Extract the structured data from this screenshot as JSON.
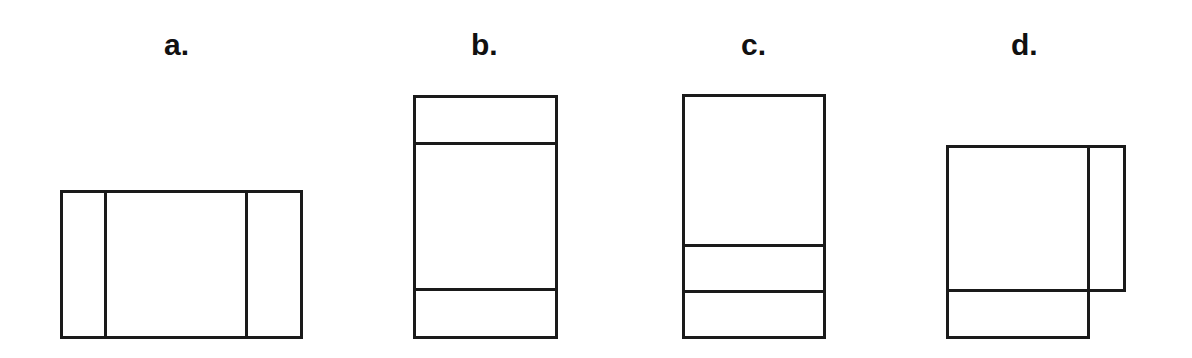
{
  "figure": {
    "background_color": "#ffffff",
    "stroke_color": "#1a1a1a",
    "stroke_width": 3,
    "width": 1192,
    "height": 358
  },
  "panels": [
    {
      "id": "a",
      "label": "a.",
      "label_x": 164,
      "label_y": 30,
      "description": "wide horizontal rectangle divided into three vertical strips by two internal vertical lines",
      "outer": {
        "x": 61,
        "y": 191,
        "width": 240,
        "height": 146
      },
      "divider_orientation": "vertical",
      "dividers": [
        105,
        246
      ],
      "part_count": 3
    },
    {
      "id": "b",
      "label": "b.",
      "label_x": 471,
      "label_y": 30,
      "description": "tall vertical rectangle divided into three horizontal bands by two internal horizontal lines",
      "outer": {
        "x": 414,
        "y": 96,
        "width": 142,
        "height": 241
      },
      "divider_orientation": "horizontal",
      "dividers": [
        143,
        289
      ],
      "part_count": 3
    },
    {
      "id": "c",
      "label": "c.",
      "label_x": 741,
      "label_y": 30,
      "description": "tall vertical rectangle divided into three horizontal bands, both dividers near the bottom",
      "outer": {
        "x": 683,
        "y": 95,
        "width": 141,
        "height": 242
      },
      "divider_orientation": "horizontal",
      "dividers": [
        245,
        291
      ],
      "part_count": 3
    },
    {
      "id": "d",
      "label": "d.",
      "label_x": 1011,
      "label_y": 30,
      "description": "two overlapping rectangles: a large square on the left with a horizontal divider near its bottom, and a narrow tall rectangle attached on its right side ending higher",
      "main": {
        "x": 947,
        "y": 146,
        "width": 141,
        "height": 191
      },
      "side": {
        "x": 1088,
        "y": 146,
        "width": 36,
        "height": 144
      },
      "main_divider_y": 290,
      "part_count": 3
    }
  ]
}
